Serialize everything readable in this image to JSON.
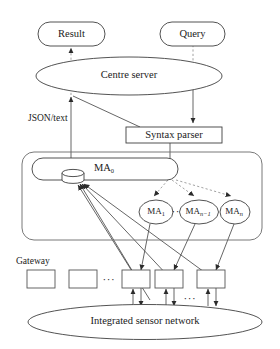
{
  "diagram": {
    "nodes": {
      "result": {
        "label": "Result",
        "shape": "rounded-rect"
      },
      "query": {
        "label": "Query",
        "shape": "rounded-rect"
      },
      "centre_server": {
        "label": "Centre server",
        "shape": "ellipse"
      },
      "syntax_parser": {
        "label": "Syntax parser",
        "shape": "rect"
      },
      "ma0": {
        "label": "MA",
        "subscript": "0",
        "shape": "stadium"
      },
      "database": {
        "label": "",
        "shape": "cylinder",
        "icon": "database-cylinder-icon"
      },
      "ma1": {
        "label": "MA",
        "subscript": "1",
        "shape": "ellipse"
      },
      "ma_n_minus_1": {
        "label": "MA",
        "subscript": "n−1",
        "shape": "ellipse"
      },
      "ma_n": {
        "label": "MA",
        "subscript": "n",
        "shape": "ellipse"
      },
      "integrated_sensor_network": {
        "label": "Integrated sensor network",
        "shape": "ellipse"
      }
    },
    "labels": {
      "json_text": "JSON/text",
      "gateway": "Gateway",
      "ellipsis_agents": "···",
      "ellipsis_gateway_row": "···",
      "ellipsis_sensor_row": "···"
    },
    "gateways": [
      {
        "id": "gateway-1",
        "label": ""
      },
      {
        "id": "gateway-2",
        "label": ""
      },
      {
        "id": "gateway-3",
        "label": ""
      },
      {
        "id": "gateway-4",
        "label": ""
      },
      {
        "id": "gateway-5",
        "label": ""
      }
    ],
    "colors": {
      "background": "#ffffff",
      "stroke": "#3f3f3f",
      "stroke_light": "#6a6a6a",
      "dashed": "#8a8a8a",
      "text": "#1a1a1a"
    }
  }
}
